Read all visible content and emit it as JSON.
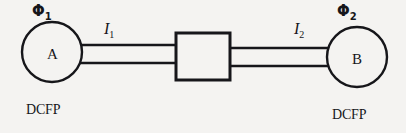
{
  "diagram": {
    "background_color": "#f4f3f1",
    "stroke_color": "#16161a",
    "nodes": [
      {
        "id": "node-a",
        "letter": "A",
        "flux_label": "Φ",
        "flux_subscript": "1",
        "caption": "DCFP",
        "cx": 52,
        "cy": 52,
        "r": 30
      },
      {
        "id": "node-b",
        "letter": "B",
        "flux_label": "Φ",
        "flux_subscript": "2",
        "caption": "DCFP",
        "cx": 357,
        "cy": 57,
        "r": 30
      }
    ],
    "coupler": {
      "id": "coupling-block",
      "x": 176,
      "y": 33,
      "width": 54,
      "height": 47
    },
    "links": [
      {
        "id": "link-left",
        "current_label": "I",
        "current_subscript": "1",
        "from": "node-a",
        "to": "coupling-block",
        "top_line_y": 45,
        "bottom_line_y": 63,
        "x_start": 81,
        "x_end": 176
      },
      {
        "id": "link-right",
        "current_label": "I",
        "current_subscript": "2",
        "from": "coupling-block",
        "to": "node-b",
        "top_line_y": 48,
        "bottom_line_y": 66,
        "x_start": 230,
        "x_end": 330
      }
    ]
  }
}
